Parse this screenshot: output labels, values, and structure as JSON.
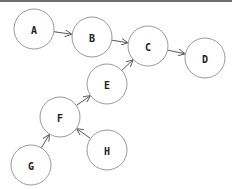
{
  "diagram": {
    "type": "directed-graph",
    "nodes": [
      {
        "id": "A",
        "label": "A",
        "x": 34,
        "y": 29
      },
      {
        "id": "B",
        "label": "B",
        "x": 92,
        "y": 37
      },
      {
        "id": "C",
        "label": "C",
        "x": 148,
        "y": 46
      },
      {
        "id": "D",
        "label": "D",
        "x": 205,
        "y": 58
      },
      {
        "id": "E",
        "label": "E",
        "x": 107,
        "y": 84
      },
      {
        "id": "F",
        "label": "F",
        "x": 60,
        "y": 117
      },
      {
        "id": "G",
        "label": "G",
        "x": 31,
        "y": 165
      },
      {
        "id": "H",
        "label": "H",
        "x": 107,
        "y": 150
      }
    ],
    "edges": [
      {
        "from": "A",
        "to": "B"
      },
      {
        "from": "B",
        "to": "C"
      },
      {
        "from": "C",
        "to": "D"
      },
      {
        "from": "E",
        "to": "C"
      },
      {
        "from": "F",
        "to": "E"
      },
      {
        "from": "G",
        "to": "F"
      },
      {
        "from": "H",
        "to": "F"
      }
    ],
    "node_radius": 20,
    "colors": {
      "node_stroke": "#9a9a9a",
      "edge": "#555555",
      "label": "#222222",
      "top_bar": "#6e6e6e"
    }
  }
}
